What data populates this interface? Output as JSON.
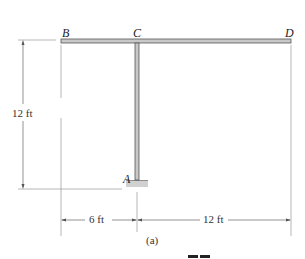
{
  "figure": {
    "caption": "(a)",
    "points": {
      "A": "A",
      "B": "B",
      "C": "C",
      "D": "D"
    },
    "dimensions": {
      "height": "12 ft",
      "left_span": "6 ft",
      "right_span": "12 ft"
    },
    "colors": {
      "member_fill": "#c8c8c8",
      "member_stroke": "#555555",
      "support_fill": "#d0d0d0",
      "dim_line": "#666666"
    }
  }
}
